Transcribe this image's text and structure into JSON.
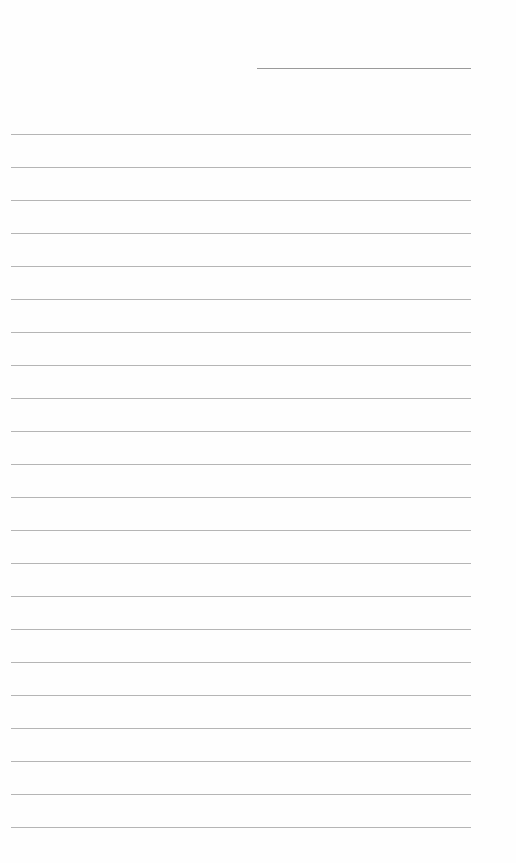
{
  "page": {
    "type": "blank lined writing page",
    "header_field": {
      "label": "",
      "value": ""
    },
    "line_count": 22,
    "first_line_y": 134,
    "line_spacing": 33,
    "line_color": "#a8a8a8",
    "lines": [
      "",
      "",
      "",
      "",
      "",
      "",
      "",
      "",
      "",
      "",
      "",
      "",
      "",
      "",
      "",
      "",
      "",
      "",
      "",
      "",
      "",
      ""
    ]
  }
}
